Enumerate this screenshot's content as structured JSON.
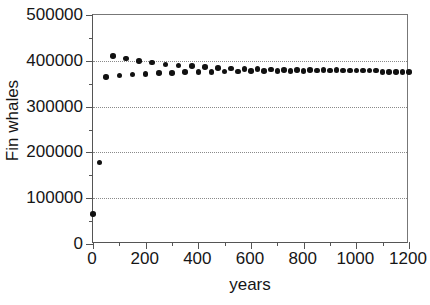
{
  "chart_data": {
    "type": "scatter",
    "title": "",
    "xlabel": "years",
    "ylabel": "Fin whales",
    "xlim": [
      0,
      1200
    ],
    "ylim": [
      0,
      500000
    ],
    "grid": true,
    "grid_axis": "y",
    "legend": "none",
    "marker": "filled-circle",
    "marker_color": "#111111",
    "x_ticks_major": [
      0,
      200,
      400,
      600,
      800,
      1000,
      1200
    ],
    "x_tick_labels": [
      "0",
      "200",
      "400",
      "600",
      "800",
      "1000",
      "1200"
    ],
    "x_ticks_minor": [
      100,
      300,
      500,
      700,
      900,
      1100
    ],
    "y_ticks_major": [
      0,
      100000,
      200000,
      300000,
      400000,
      500000
    ],
    "y_tick_labels": [
      "0",
      "100000",
      "200000",
      "300000",
      "400000",
      "500000"
    ],
    "y_ticks_minor": [
      50000,
      150000,
      250000,
      350000,
      450000
    ],
    "x": [
      0,
      25,
      50,
      75,
      100,
      125,
      150,
      175,
      200,
      225,
      250,
      275,
      300,
      325,
      350,
      375,
      400,
      425,
      450,
      475,
      500,
      525,
      550,
      575,
      600,
      625,
      650,
      675,
      700,
      725,
      750,
      775,
      800,
      825,
      850,
      875,
      900,
      925,
      950,
      975,
      1000,
      1025,
      1050,
      1075,
      1100,
      1125,
      1150,
      1175,
      1200
    ],
    "values": [
      65000,
      178000,
      365000,
      410000,
      368000,
      405000,
      370000,
      399000,
      371000,
      396000,
      373000,
      392000,
      374000,
      390000,
      375000,
      388000,
      375500,
      386000,
      376000,
      384500,
      376500,
      383500,
      377000,
      382500,
      377200,
      382000,
      377500,
      381000,
      377800,
      380500,
      378000,
      380000,
      378200,
      379800,
      378400,
      379500,
      378600,
      379300,
      378800,
      379100,
      378900,
      379000,
      378950,
      379000,
      375000,
      375000,
      375000,
      375000,
      375000
    ]
  },
  "figure": {
    "background_color": "#ffffff",
    "axis_color": "#555555",
    "grid_color": "#8a8a8a"
  }
}
